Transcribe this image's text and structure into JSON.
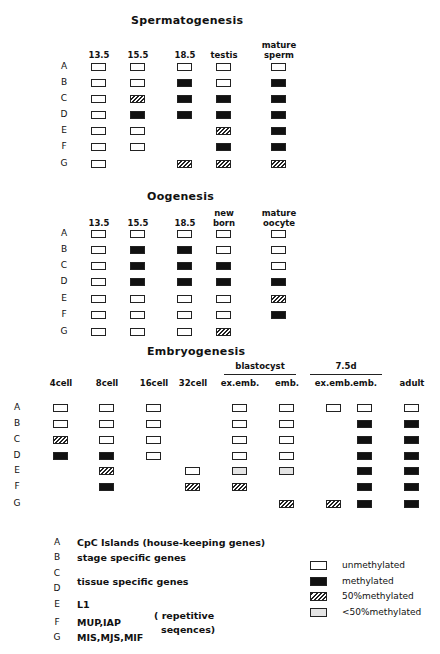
{
  "chart_data": {
    "type": "table",
    "states": {
      "u": "unmethylated",
      "m": "methylated",
      "h": "50%methylated",
      "l": "<50%methylated"
    },
    "rows": [
      "A",
      "B",
      "C",
      "D",
      "E",
      "F",
      "G"
    ],
    "panels": [
      {
        "title": "Spermatogenesis",
        "columns": [
          "13.5",
          "15.5",
          "18.5",
          "testis",
          "mature sperm"
        ],
        "matrix": [
          [
            "u",
            "u",
            "u",
            "u",
            "u"
          ],
          [
            "u",
            "u",
            "m",
            "u",
            "m"
          ],
          [
            "u",
            "h",
            "m",
            "m",
            "m"
          ],
          [
            "u",
            "m",
            "m",
            "m",
            "m"
          ],
          [
            "u",
            "u",
            null,
            "h",
            "m"
          ],
          [
            "u",
            "u",
            null,
            "m",
            "m"
          ],
          [
            "u",
            null,
            "h",
            "h",
            "h"
          ]
        ]
      },
      {
        "title": "Oogenesis",
        "columns": [
          "13.5",
          "15.5",
          "18.5",
          "new born",
          "mature oocyte"
        ],
        "matrix": [
          [
            "u",
            "u",
            "u",
            "u",
            "u"
          ],
          [
            "u",
            "m",
            "m",
            "u",
            "u"
          ],
          [
            "u",
            "m",
            "m",
            "m",
            "u"
          ],
          [
            "u",
            "m",
            "m",
            "m",
            "m"
          ],
          [
            "u",
            "u",
            "u",
            "u",
            "h"
          ],
          [
            "u",
            "u",
            "u",
            "u",
            "m"
          ],
          [
            "u",
            "u",
            "u",
            "h",
            null
          ]
        ]
      },
      {
        "title": "Embryogenesis",
        "columns": [
          "4cell",
          "8cell",
          "16cell",
          "32cell",
          "blastocyst ex.emb.",
          "blastocyst emb.",
          "7.5d ex.emb.",
          "7.5d emb.",
          "adult"
        ],
        "matrix": [
          [
            "u",
            "u",
            "u",
            null,
            "u",
            "u",
            "u",
            "u",
            "u"
          ],
          [
            "u",
            "u",
            "u",
            null,
            "u",
            "u",
            null,
            "m",
            "m"
          ],
          [
            "h",
            "u",
            "u",
            null,
            "u",
            "u",
            null,
            "m",
            "m"
          ],
          [
            "m",
            "m",
            "u",
            null,
            "u",
            "u",
            null,
            "m",
            "m"
          ],
          [
            null,
            "h",
            null,
            "u",
            "l",
            "l",
            null,
            "m",
            "m"
          ],
          [
            null,
            "m",
            null,
            "h",
            "h",
            null,
            null,
            "m",
            "m"
          ],
          [
            null,
            null,
            null,
            null,
            null,
            "h",
            "h",
            "m",
            "m"
          ]
        ]
      }
    ]
  },
  "spermatogenesis": {
    "title": "Spermatogenesis",
    "cols": [
      {
        "l1": "",
        "l2": "13.5"
      },
      {
        "l1": "",
        "l2": "15.5"
      },
      {
        "l1": "",
        "l2": "18.5"
      },
      {
        "l1": "",
        "l2": "testis"
      },
      {
        "l1": "mature",
        "l2": "sperm"
      }
    ]
  },
  "oogenesis": {
    "title": "Oogenesis",
    "cols": [
      {
        "l1": "",
        "l2": "13.5"
      },
      {
        "l1": "",
        "l2": "15.5"
      },
      {
        "l1": "",
        "l2": "18.5"
      },
      {
        "l1": "new",
        "l2": "born"
      },
      {
        "l1": "mature",
        "l2": "oocyte"
      }
    ]
  },
  "embryogenesis": {
    "title": "Embryogenesis",
    "group1": "blastocyst",
    "group2": "7.5d",
    "cols": [
      "4cell",
      "8cell",
      "16cell",
      "32cell",
      "ex.emb.",
      "emb.",
      "ex.emb.",
      "emb.",
      "adult"
    ]
  },
  "row_labels": [
    "A",
    "B",
    "C",
    "D",
    "E",
    "F",
    "G"
  ],
  "legend": {
    "rows": [
      {
        "letter": "A",
        "text": "CpC Islands   (house-keeping genes)"
      },
      {
        "letter": "B",
        "text": "stage specific genes"
      },
      {
        "letter": "C",
        "text": ""
      },
      {
        "letter": "D",
        "text": ""
      },
      {
        "letter": "E",
        "text": "L1"
      },
      {
        "letter": "F",
        "text": "MUP,IAP"
      },
      {
        "letter": "G",
        "text": "MIS,MJS,MIF"
      }
    ],
    "cd_text": "tissue specific genes",
    "repetitive_1": "( repetitive",
    "repetitive_2": "seqences)",
    "keys": [
      {
        "state": "u",
        "label": "unmethylated"
      },
      {
        "state": "m",
        "label": "methylated"
      },
      {
        "state": "h",
        "label": "50%methylated"
      },
      {
        "state": "l",
        "label": "<50%methylated"
      }
    ]
  }
}
